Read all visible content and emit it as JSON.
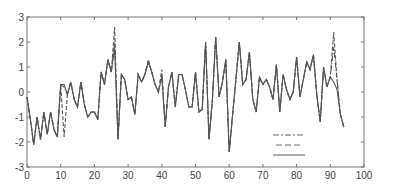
{
  "chart_data": {
    "type": "line",
    "title": "",
    "xlabel": "",
    "ylabel": "",
    "xlim": [
      0,
      100
    ],
    "ylim": [
      -3,
      3
    ],
    "grid": false,
    "x_ticks": [
      0,
      10,
      20,
      30,
      40,
      50,
      60,
      70,
      80,
      90,
      100
    ],
    "y_ticks": [
      -3,
      -2,
      -1,
      0,
      1,
      2,
      3
    ],
    "legend": {
      "position": "lower-center-right",
      "entries": [
        {
          "style": "dash-dot",
          "label": ""
        },
        {
          "style": "dashed",
          "label": ""
        },
        {
          "style": "solid",
          "label": ""
        }
      ]
    },
    "x": [
      0,
      1,
      2,
      3,
      4,
      5,
      6,
      7,
      8,
      9,
      10,
      11,
      12,
      13,
      14,
      15,
      16,
      17,
      18,
      19,
      20,
      21,
      22,
      23,
      24,
      25,
      26,
      27,
      28,
      29,
      30,
      31,
      32,
      33,
      34,
      35,
      36,
      37,
      38,
      39,
      40,
      41,
      42,
      43,
      44,
      45,
      46,
      47,
      48,
      49,
      50,
      51,
      52,
      53,
      54,
      55,
      56,
      57,
      58,
      59,
      60,
      61,
      62,
      63,
      64,
      65,
      66,
      67,
      68,
      69,
      70,
      71,
      72,
      73,
      74,
      75,
      76,
      77,
      78,
      79,
      80,
      81,
      82,
      83,
      84,
      85,
      86,
      87,
      88,
      89,
      90,
      91,
      92,
      93,
      94
    ],
    "series": [
      {
        "name": "series-solid",
        "style": "solid",
        "values": [
          -0.2,
          -1.1,
          -2.1,
          -1.0,
          -1.9,
          -0.8,
          -1.7,
          -0.8,
          -1.5,
          -1.8,
          0.3,
          0.3,
          -0.1,
          0.4,
          -0.3,
          -0.6,
          0.4,
          -0.5,
          -1.0,
          -0.8,
          -0.8,
          -1.1,
          0.8,
          0.3,
          1.3,
          0.8,
          1.8,
          -1.9,
          0.7,
          0.5,
          -0.3,
          -0.2,
          -0.9,
          0.7,
          0.4,
          0.7,
          1.2,
          0.8,
          0.3,
          0.0,
          0.6,
          -1.4,
          0.2,
          0.8,
          -0.6,
          0.7,
          0.7,
          0.1,
          -0.6,
          -0.6,
          0.8,
          -0.8,
          -0.7,
          2.0,
          -1.9,
          -0.3,
          2.2,
          -0.2,
          0.4,
          1.3,
          -2.4,
          -0.9,
          0.5,
          2.0,
          0.3,
          0.5,
          1.6,
          -0.3,
          -0.8,
          0.6,
          0.3,
          0.5,
          0.2,
          -0.3,
          1.1,
          -0.8,
          0.7,
          0.1,
          -0.3,
          0.0,
          1.4,
          -0.2,
          0.5,
          1.2,
          0.9,
          1.5,
          -0.1,
          -1.2,
          1.0,
          0.2,
          0.6,
          0.4,
          0.1,
          -0.9,
          -1.4
        ]
      },
      {
        "name": "series-dashed",
        "style": "dashed",
        "values": [
          -0.2,
          -1.1,
          -2.1,
          -1.0,
          -1.9,
          -0.8,
          -1.7,
          -0.8,
          -1.5,
          -1.8,
          0.3,
          -1.8,
          -0.1,
          0.4,
          -0.3,
          -0.6,
          0.4,
          -0.5,
          -1.0,
          -0.8,
          -0.8,
          -1.1,
          0.8,
          0.3,
          1.3,
          0.8,
          2.6,
          -1.9,
          0.7,
          0.5,
          -0.3,
          -0.2,
          -0.9,
          0.7,
          0.4,
          0.7,
          1.3,
          0.8,
          0.3,
          0.0,
          0.9,
          -1.4,
          0.2,
          0.8,
          -0.6,
          0.7,
          0.7,
          0.1,
          -0.6,
          -0.6,
          0.8,
          -0.8,
          -0.7,
          2.0,
          -1.9,
          -0.3,
          2.2,
          -0.2,
          0.4,
          1.3,
          -2.4,
          -0.9,
          0.5,
          2.0,
          0.3,
          0.5,
          1.6,
          -0.3,
          -0.8,
          0.6,
          0.3,
          0.5,
          0.2,
          -0.3,
          1.1,
          -0.8,
          0.7,
          0.1,
          -0.3,
          0.0,
          1.4,
          -0.2,
          0.5,
          1.2,
          0.9,
          1.5,
          -0.1,
          -1.2,
          1.0,
          0.2,
          0.6,
          2.4,
          0.5,
          -0.9,
          -1.4
        ]
      },
      {
        "name": "series-dash-dot",
        "style": "dash-dot",
        "values": [
          -0.2,
          -1.1,
          -2.1,
          -1.0,
          -1.9,
          -0.8,
          -1.7,
          -0.8,
          -1.5,
          -1.8,
          0.3,
          0.2,
          -0.1,
          0.4,
          -0.3,
          -0.6,
          0.4,
          -0.5,
          -1.0,
          -0.8,
          -0.8,
          -1.1,
          0.8,
          0.3,
          1.3,
          0.8,
          2.0,
          -1.9,
          0.7,
          0.5,
          -0.3,
          -0.2,
          -0.9,
          0.7,
          0.4,
          0.7,
          1.2,
          0.8,
          0.3,
          0.0,
          0.7,
          -1.4,
          0.2,
          0.8,
          -0.6,
          0.7,
          0.7,
          0.1,
          -0.6,
          -0.6,
          0.8,
          -0.8,
          -0.7,
          2.0,
          -1.9,
          -0.3,
          2.2,
          -0.2,
          0.4,
          1.3,
          -2.4,
          -0.9,
          0.5,
          2.0,
          0.3,
          0.5,
          1.6,
          -0.3,
          -0.8,
          0.6,
          0.3,
          0.5,
          0.2,
          -0.3,
          1.1,
          -0.8,
          0.7,
          0.1,
          -0.3,
          0.0,
          1.4,
          -0.2,
          0.5,
          1.2,
          0.9,
          1.5,
          -0.1,
          -1.2,
          1.0,
          0.2,
          0.6,
          1.8,
          0.5,
          -0.9,
          -1.4
        ]
      }
    ]
  },
  "colors": {
    "line": "#555555",
    "axis": "#666666",
    "background": "#ffffff"
  }
}
